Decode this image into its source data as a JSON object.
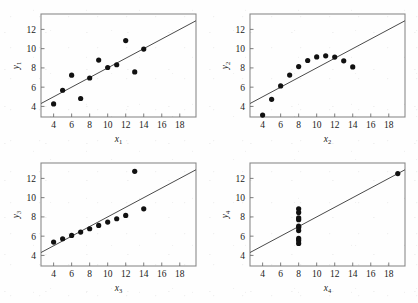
{
  "figure": {
    "panel_count": 4,
    "background_color": "#fefefe",
    "point_color": "#111111",
    "line_color": "#4a4a4a",
    "frame_color": "#8a8a8a"
  },
  "axes_common": {
    "x_ticks": [
      4,
      6,
      8,
      10,
      12,
      14,
      16,
      18
    ],
    "y_ticks": [
      4,
      6,
      8,
      10,
      12
    ],
    "xlim": [
      2.6,
      19.8
    ],
    "ylim": [
      2.9,
      13.6
    ],
    "grid": false,
    "legend": false
  },
  "chart_data": [
    {
      "type": "scatter",
      "title": "",
      "xlabel": "x",
      "xlabel_sub": "1",
      "ylabel": "y",
      "ylabel_sub": "1",
      "x": [
        10,
        8,
        13,
        9,
        11,
        14,
        6,
        4,
        12,
        7,
        5
      ],
      "y": [
        8.04,
        6.95,
        7.58,
        8.81,
        8.33,
        9.96,
        7.24,
        4.26,
        10.84,
        4.82,
        5.68
      ],
      "xlim": [
        2.6,
        19.8
      ],
      "ylim": [
        2.9,
        13.6
      ],
      "xticks": [
        4,
        6,
        8,
        10,
        12,
        14,
        16,
        18
      ],
      "yticks": [
        4,
        6,
        8,
        10,
        12
      ],
      "fit_line": {
        "intercept": 3.0,
        "slope": 0.5
      },
      "grid": false
    },
    {
      "type": "scatter",
      "title": "",
      "xlabel": "x",
      "xlabel_sub": "2",
      "ylabel": "y",
      "ylabel_sub": "2",
      "x": [
        10,
        8,
        13,
        9,
        11,
        14,
        6,
        4,
        12,
        7,
        5
      ],
      "y": [
        9.14,
        8.14,
        8.74,
        8.77,
        9.26,
        8.1,
        6.13,
        3.1,
        9.13,
        7.26,
        4.74
      ],
      "xlim": [
        2.6,
        19.8
      ],
      "ylim": [
        2.9,
        13.6
      ],
      "xticks": [
        4,
        6,
        8,
        10,
        12,
        14,
        16,
        18
      ],
      "yticks": [
        4,
        6,
        8,
        10,
        12
      ],
      "fit_line": {
        "intercept": 3.0,
        "slope": 0.5
      },
      "grid": false
    },
    {
      "type": "scatter",
      "title": "",
      "xlabel": "x",
      "xlabel_sub": "3",
      "ylabel": "y",
      "ylabel_sub": "3",
      "x": [
        10,
        8,
        13,
        9,
        11,
        14,
        6,
        4,
        12,
        7,
        5
      ],
      "y": [
        7.46,
        6.77,
        12.74,
        7.11,
        7.81,
        8.84,
        6.08,
        5.39,
        8.15,
        6.42,
        5.73
      ],
      "xlim": [
        2.6,
        19.8
      ],
      "ylim": [
        2.9,
        13.6
      ],
      "xticks": [
        4,
        6,
        8,
        10,
        12,
        14,
        16,
        18
      ],
      "yticks": [
        4,
        6,
        8,
        10,
        12
      ],
      "fit_line": {
        "intercept": 3.0,
        "slope": 0.5
      },
      "grid": false
    },
    {
      "type": "scatter",
      "title": "",
      "xlabel": "x",
      "xlabel_sub": "4",
      "ylabel": "y",
      "ylabel_sub": "4",
      "x": [
        8,
        8,
        8,
        8,
        8,
        8,
        8,
        19,
        8,
        8,
        8
      ],
      "y": [
        6.58,
        5.76,
        7.71,
        8.84,
        8.47,
        7.04,
        5.25,
        12.5,
        5.56,
        7.91,
        6.89
      ],
      "xlim": [
        2.6,
        19.8
      ],
      "ylim": [
        2.9,
        13.6
      ],
      "xticks": [
        4,
        6,
        8,
        10,
        12,
        14,
        16,
        18
      ],
      "yticks": [
        4,
        6,
        8,
        10,
        12
      ],
      "fit_line": {
        "intercept": 3.0,
        "slope": 0.5
      },
      "grid": false
    }
  ]
}
